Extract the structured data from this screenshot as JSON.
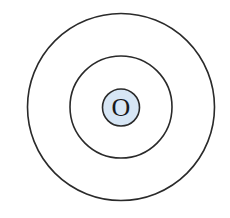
{
  "diagram": {
    "type": "concentric-circles",
    "center": {
      "x": 121,
      "y": 107
    },
    "stroke_color": "#2a2a2a",
    "circles": [
      {
        "name": "outer-circle",
        "radius": 93.5,
        "fill": "none",
        "stroke_width": 1.6
      },
      {
        "name": "middle-circle",
        "radius": 51,
        "fill": "none",
        "stroke_width": 1.6
      },
      {
        "name": "center-circle",
        "radius": 18.5,
        "fill": "#d7e6f5",
        "stroke_width": 1.6
      }
    ],
    "center_label": "O"
  }
}
